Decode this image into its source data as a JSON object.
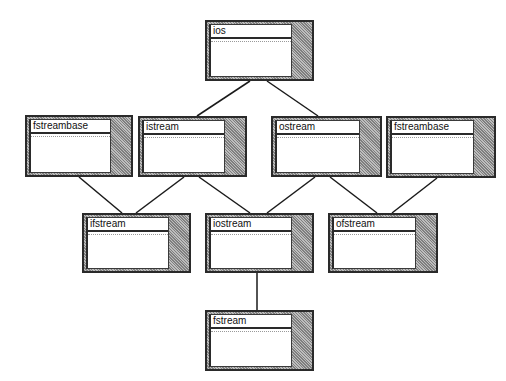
{
  "diagram": {
    "type": "class-hierarchy",
    "nodes": [
      {
        "id": "ios",
        "label": "ios"
      },
      {
        "id": "fstreambase_left",
        "label": "fstreambase"
      },
      {
        "id": "istream",
        "label": "istream"
      },
      {
        "id": "ostream",
        "label": "ostream"
      },
      {
        "id": "fstreambase_right",
        "label": "fstreambase"
      },
      {
        "id": "ifstream",
        "label": "ifstream"
      },
      {
        "id": "iostream",
        "label": "iostream"
      },
      {
        "id": "ofstream",
        "label": "ofstream"
      },
      {
        "id": "fstream",
        "label": "fstream"
      }
    ],
    "edges": [
      {
        "from": "ios",
        "to": "istream"
      },
      {
        "from": "ios",
        "to": "ostream"
      },
      {
        "from": "fstreambase_left",
        "to": "ifstream"
      },
      {
        "from": "istream",
        "to": "ifstream"
      },
      {
        "from": "istream",
        "to": "iostream"
      },
      {
        "from": "ostream",
        "to": "iostream"
      },
      {
        "from": "ostream",
        "to": "ofstream"
      },
      {
        "from": "fstreambase_right",
        "to": "ofstream"
      },
      {
        "from": "iostream",
        "to": "fstream"
      }
    ]
  },
  "colors": {
    "line": "#1a1a1a",
    "border": "#2a2a2a",
    "shade": "#9a9a9a",
    "background": "#ffffff"
  }
}
